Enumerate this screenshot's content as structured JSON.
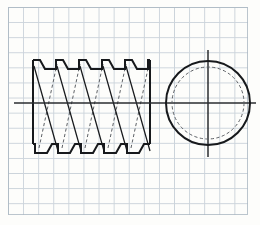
{
  "sheet": {
    "kind": "engineering-sketch",
    "medium": "graph paper",
    "paper_color": "#fdfdfb",
    "grid_color": "#b9c4cf",
    "grid_cell_px": 15,
    "ink_color": "#17191c",
    "width_px": 260,
    "height_px": 225,
    "title": "",
    "labels": [],
    "dimensions": [],
    "annotations": []
  },
  "grid": {
    "origin_x": 8,
    "origin_y": 7,
    "width": 240,
    "height": 208,
    "columns": 16,
    "rows": 14,
    "border": true
  },
  "views": {
    "front_view": {
      "name": "helical-spring-front-view",
      "description": "Helical compression spring with square/trapezoidal wire section, shown in elevation with visible and hidden coil edges and diagonal coil hatching",
      "left_x": 33,
      "right_x": 150,
      "top_y": 60,
      "bottom_y": 153,
      "coil_count": 5,
      "pitch_px": 23,
      "centerline_y": 103,
      "centerline_start_x": 14,
      "centerline_end_x": 160,
      "outer_diameter_px": 85,
      "tooth_profile": "trapezoid"
    },
    "side_view": {
      "name": "helical-spring-end-view",
      "description": "End view of the spring: solid outer coil circle with dashed inner coil circle and crossed centerlines",
      "center_x": 208,
      "center_y": 103,
      "outer_radius_px": 42,
      "inner_radius_px": 36,
      "outer_style": "solid",
      "inner_style": "hidden-dashed",
      "centerline_extension_px": 10
    }
  },
  "legend": {
    "solid_line": "visible edge",
    "dashed_line": "hidden edge",
    "thin_line": "coil hatching",
    "chain_line": "centre line"
  }
}
